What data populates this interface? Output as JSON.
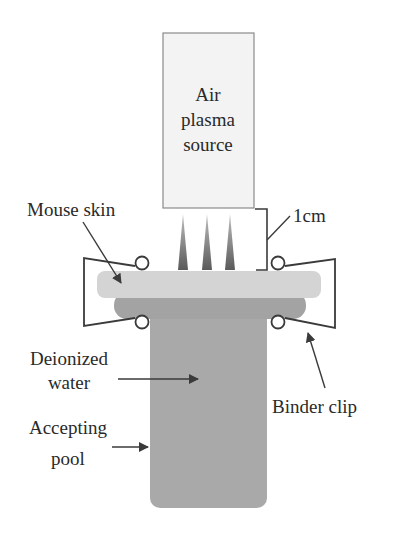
{
  "diagram": {
    "source": {
      "lines": [
        "Air",
        "plasma",
        "source"
      ]
    },
    "labels": {
      "distance": "1cm",
      "mouse_skin": "Mouse skin",
      "water_line1": "Deionized",
      "water_line2": "water",
      "pool_line1": "Accepting",
      "pool_line2": "pool",
      "clip": "Binder clip"
    },
    "colors": {
      "source_fill": "#f3f3f3",
      "source_border": "#8a8a8a",
      "jet": "#6e6e6e",
      "skin": "#d6d6d6",
      "water": "#a8a8a8",
      "pool": "#a9a9a9",
      "line": "#3a3a3a"
    }
  }
}
